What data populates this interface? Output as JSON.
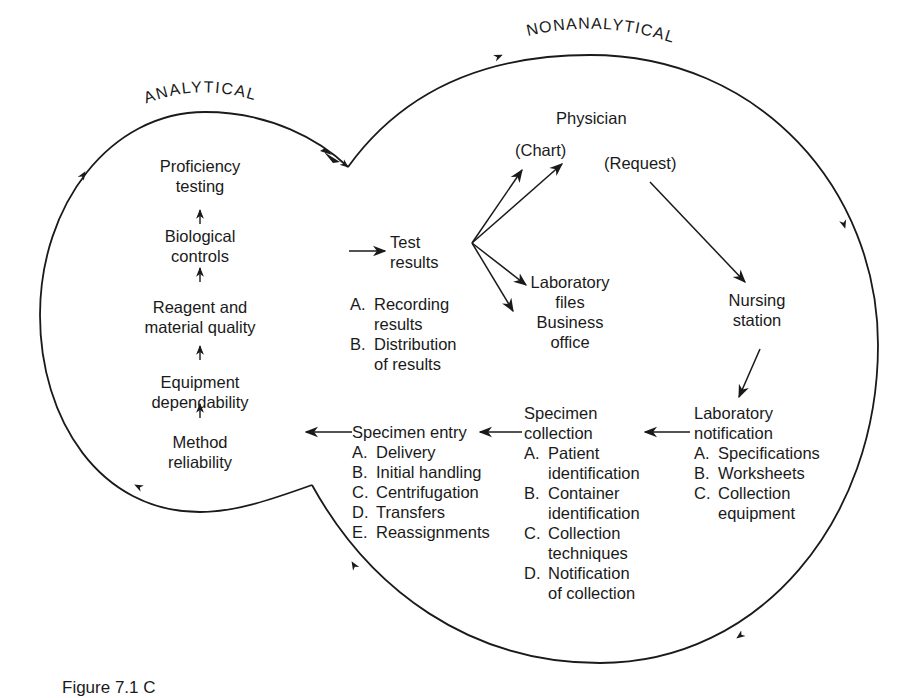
{
  "figure": {
    "caption_partial": "Figure 7.1  C",
    "regions": {
      "analytical": "ANALYTICAL",
      "nonanalytical": "NONANALYTICAL"
    }
  },
  "analytical": {
    "chain": [
      {
        "lines": [
          "Proficiency",
          "testing"
        ]
      },
      {
        "lines": [
          "Biological",
          "controls"
        ]
      },
      {
        "lines": [
          "Reagent and",
          "material quality"
        ]
      },
      {
        "lines": [
          "Equipment",
          "dependability"
        ]
      },
      {
        "lines": [
          "Method",
          "reliability"
        ]
      }
    ]
  },
  "nonanalytical": {
    "physician": "Physician",
    "chart": "(Chart)",
    "request": "(Request)",
    "test_results": {
      "title": [
        "Test",
        "results"
      ],
      "items": [
        {
          "key": "A.",
          "lines": [
            "Recording",
            "results"
          ]
        },
        {
          "key": "B.",
          "lines": [
            "Distribution",
            "of results"
          ]
        }
      ]
    },
    "lab_files": [
      "Laboratory",
      "files",
      "Business",
      "office"
    ],
    "nursing_station": [
      "Nursing",
      "station"
    ],
    "lab_notification": {
      "title": [
        "Laboratory",
        "notification"
      ],
      "items": [
        {
          "key": "A.",
          "lines": [
            "Specifications"
          ]
        },
        {
          "key": "B.",
          "lines": [
            "Worksheets"
          ]
        },
        {
          "key": "C.",
          "lines": [
            "Collection",
            "equipment"
          ]
        }
      ]
    },
    "specimen_collection": {
      "title": [
        "Specimen",
        "collection"
      ],
      "items": [
        {
          "key": "A.",
          "lines": [
            "Patient",
            "identification"
          ]
        },
        {
          "key": "B.",
          "lines": [
            "Container",
            "identification"
          ]
        },
        {
          "key": "C.",
          "lines": [
            "Collection",
            "techniques"
          ]
        },
        {
          "key": "D.",
          "lines": [
            "Notification",
            "of collection"
          ]
        }
      ]
    },
    "specimen_entry": {
      "title": "Specimen entry",
      "items": [
        {
          "key": "A.",
          "lines": [
            "Delivery"
          ]
        },
        {
          "key": "B.",
          "lines": [
            "Initial handling"
          ]
        },
        {
          "key": "C.",
          "lines": [
            "Centrifugation"
          ]
        },
        {
          "key": "D.",
          "lines": [
            "Transfers"
          ]
        },
        {
          "key": "E.",
          "lines": [
            "Reassignments"
          ]
        }
      ]
    }
  },
  "style": {
    "ink": "#1a1a1a",
    "background": "#ffffff"
  }
}
